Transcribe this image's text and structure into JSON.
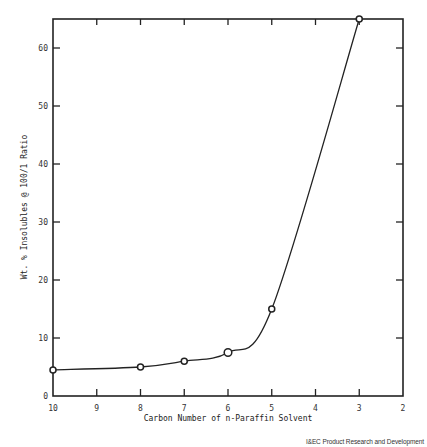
{
  "chart_data": {
    "type": "line",
    "title": "",
    "xlabel": "Carbon Number of n-Paraffin Solvent",
    "ylabel": "Wt. % Insolubles @ 100/1 Ratio",
    "x": [
      10,
      8,
      7,
      6,
      5,
      3
    ],
    "series": [
      {
        "name": "Insolubles",
        "values": [
          4.5,
          5.0,
          6.0,
          7.5,
          15.0,
          65.0
        ]
      }
    ],
    "xlim": [
      10,
      2
    ],
    "x_reversed": true,
    "ylim": [
      0,
      65
    ],
    "xticks": [
      10,
      9,
      8,
      7,
      6,
      5,
      4,
      3,
      2
    ],
    "yticks": [
      0,
      10,
      20,
      30,
      40,
      50,
      60
    ],
    "grid": false,
    "markers": "open-circle",
    "smooth_curve": true
  },
  "credit": "I&EC Product Research and Development"
}
